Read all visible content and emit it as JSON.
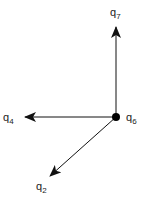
{
  "diagram": {
    "type": "state-transition",
    "background": "#ffffff",
    "stroke_color": "#111111",
    "center_node": {
      "id": "q6",
      "label": "q",
      "subscript": "6",
      "x": 116,
      "y": 117
    },
    "targets": [
      {
        "id": "q7",
        "label": "q",
        "subscript": "7",
        "tip_x": 116,
        "tip_y": 27,
        "label_x": 110,
        "label_y": 16
      },
      {
        "id": "q4",
        "label": "q",
        "subscript": "4",
        "tip_x": 25,
        "tip_y": 117,
        "label_x": 3,
        "label_y": 121
      },
      {
        "id": "q2",
        "label": "q",
        "subscript": "2",
        "tip_x": 50,
        "tip_y": 176,
        "label_x": 36,
        "label_y": 190
      }
    ],
    "edges": [
      {
        "from": "q6",
        "to": "q7"
      },
      {
        "from": "q6",
        "to": "q4"
      },
      {
        "from": "q6",
        "to": "q2"
      }
    ]
  }
}
